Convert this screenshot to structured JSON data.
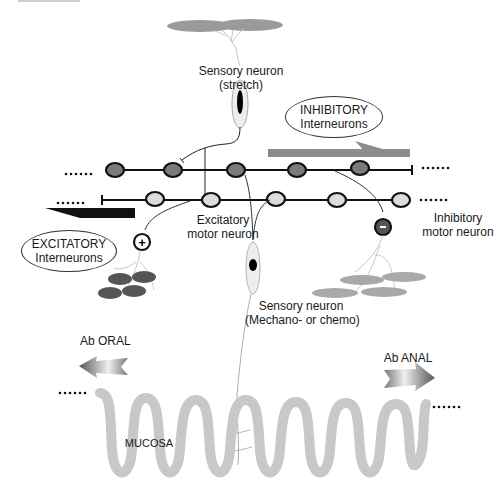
{
  "diagram": {
    "type": "enteric-nervous-system-peristaltic-reflex",
    "labels": {
      "sensory_stretch_line1": "Sensory neuron",
      "sensory_stretch_line2": "(stretch)",
      "inhibitory_interneurons_line1": "INHIBITORY",
      "inhibitory_interneurons_line2": "Interneurons",
      "excitatory_interneurons_line1": "EXCITATORY",
      "excitatory_interneurons_line2": "Interneurons",
      "excitatory_motor_line1": "Excitatory",
      "excitatory_motor_line2": "motor neuron",
      "inhibitory_motor_line1": "Inhibitory",
      "inhibitory_motor_line2": "motor neuron",
      "sensory_mechano_line1": "Sensory neuron",
      "sensory_mechano_line2": "(Mechano- or chemo)",
      "ab_oral": "Ab ORAL",
      "ab_anal": "Ab ANAL",
      "mucosa": "MUCOSA",
      "plus_sign": "+",
      "minus_sign": "-",
      "ellipsis": "......"
    },
    "colors": {
      "inhibitory_neuron_fill": "#7a7a7a",
      "excitatory_neuron_fill": "#dcdcdc",
      "excitatory_arrow": "#111111",
      "inhibitory_arrow": "#8c8c8c",
      "muscle_dark": "#555555",
      "muscle_light": "#a9a9a9",
      "mucosa": "#c8c8c8"
    },
    "nodes": {
      "inhibitory_chain_x": [
        115,
        173,
        236,
        297,
        360
      ],
      "inhibitory_chain_y": 170,
      "excitatory_chain_x": [
        155,
        211,
        276,
        337,
        401
      ],
      "excitatory_chain_y": 200
    }
  }
}
